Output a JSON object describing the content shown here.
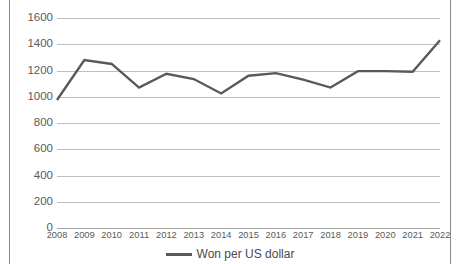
{
  "chart_data": {
    "type": "line",
    "title": "",
    "subtitle": "",
    "xlabel": "",
    "ylabel": "",
    "categories": [
      "2008",
      "2009",
      "2010",
      "2011",
      "2012",
      "2013",
      "2014",
      "2015",
      "2016",
      "2017",
      "2018",
      "2019",
      "2020",
      "2021",
      "2022"
    ],
    "series": [
      {
        "name": "Won per US dollar",
        "color": "#595959",
        "values": [
          975,
          1280,
          1250,
          1070,
          1175,
          1135,
          1025,
          1160,
          1180,
          1130,
          1070,
          1195,
          1195,
          1190,
          1430
        ]
      }
    ],
    "ylim": [
      0,
      1600
    ],
    "yticks": [
      0,
      200,
      400,
      600,
      800,
      1000,
      1200,
      1400,
      1600
    ],
    "ytick_labels": [
      "0",
      "200",
      "400",
      "600",
      "800",
      "1000",
      "1200",
      "1400",
      "1600"
    ],
    "grid": true,
    "grid_axis": "y",
    "legend": {
      "position": "bottom",
      "entries": [
        {
          "label": "Won per US dollar",
          "color": "#595959",
          "marker": "line"
        }
      ]
    },
    "colors": {
      "series_line": "#595959",
      "gridline": "#bfbfbf",
      "axis": "#a6a6a6",
      "tick_text": "#5a5a5a",
      "frame_border": "#8a8a8a",
      "background": "#ffffff"
    }
  }
}
